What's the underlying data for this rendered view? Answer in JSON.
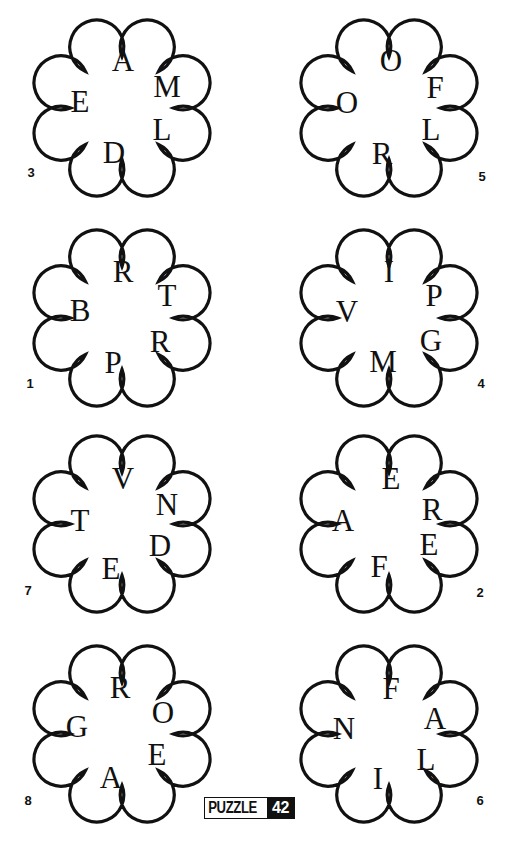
{
  "puzzle_badge": {
    "label": "PUZZLE",
    "number": "42"
  },
  "colors": {
    "ink": "#111111",
    "background": "#ffffff"
  },
  "clouds": [
    {
      "id": "3",
      "center": [
        122,
        108
      ],
      "number_pos": [
        31,
        172
      ],
      "letters": [
        {
          "char": "A",
          "dx": 1,
          "dy": -48
        },
        {
          "char": "M",
          "dx": 45,
          "dy": -22
        },
        {
          "char": "E",
          "dx": -42,
          "dy": -7
        },
        {
          "char": "L",
          "dx": 40,
          "dy": 21
        },
        {
          "char": "D",
          "dx": -8,
          "dy": 44
        }
      ]
    },
    {
      "id": "5",
      "center": [
        389,
        108
      ],
      "number_pos": [
        482,
        176
      ],
      "letters": [
        {
          "char": "O",
          "dx": 2,
          "dy": -48
        },
        {
          "char": "F",
          "dx": 46,
          "dy": -21
        },
        {
          "char": "O",
          "dx": -42,
          "dy": -6
        },
        {
          "char": "L",
          "dx": 42,
          "dy": 21
        },
        {
          "char": "R",
          "dx": -7,
          "dy": 45
        }
      ]
    },
    {
      "id": "1",
      "center": [
        122,
        318
      ],
      "number_pos": [
        30,
        383
      ],
      "letters": [
        {
          "char": "R",
          "dx": 1,
          "dy": -47
        },
        {
          "char": "T",
          "dx": 45,
          "dy": -23
        },
        {
          "char": "B",
          "dx": -42,
          "dy": -8
        },
        {
          "char": "R",
          "dx": 38,
          "dy": 23
        },
        {
          "char": "P",
          "dx": -9,
          "dy": 44
        }
      ]
    },
    {
      "id": "4",
      "center": [
        389,
        318
      ],
      "number_pos": [
        481,
        383
      ],
      "letters": [
        {
          "char": "I",
          "dx": 0,
          "dy": -47
        },
        {
          "char": "P",
          "dx": 45,
          "dy": -23
        },
        {
          "char": "V",
          "dx": -42,
          "dy": -7
        },
        {
          "char": "G",
          "dx": 42,
          "dy": 22
        },
        {
          "char": "M",
          "dx": -6,
          "dy": 43
        }
      ]
    },
    {
      "id": "7",
      "center": [
        122,
        524
      ],
      "number_pos": [
        28,
        590
      ],
      "letters": [
        {
          "char": "V",
          "dx": 1,
          "dy": -46
        },
        {
          "char": "N",
          "dx": 45,
          "dy": -20
        },
        {
          "char": "T",
          "dx": -42,
          "dy": -4
        },
        {
          "char": "D",
          "dx": 38,
          "dy": 21
        },
        {
          "char": "E",
          "dx": -11,
          "dy": 44
        }
      ]
    },
    {
      "id": "2",
      "center": [
        389,
        524
      ],
      "number_pos": [
        480,
        592
      ],
      "letters": [
        {
          "char": "E",
          "dx": 2,
          "dy": -46
        },
        {
          "char": "R",
          "dx": 43,
          "dy": -15
        },
        {
          "char": "A",
          "dx": -46,
          "dy": -4
        },
        {
          "char": "E",
          "dx": 40,
          "dy": 20
        },
        {
          "char": "F",
          "dx": -10,
          "dy": 42
        }
      ]
    },
    {
      "id": "8",
      "center": [
        122,
        734
      ],
      "number_pos": [
        28,
        800
      ],
      "letters": [
        {
          "char": "R",
          "dx": -2,
          "dy": -47
        },
        {
          "char": "O",
          "dx": 41,
          "dy": -22
        },
        {
          "char": "G",
          "dx": -45,
          "dy": -8
        },
        {
          "char": "E",
          "dx": 35,
          "dy": 20
        },
        {
          "char": "A",
          "dx": -11,
          "dy": 43
        }
      ]
    },
    {
      "id": "6",
      "center": [
        389,
        734
      ],
      "number_pos": [
        480,
        800
      ],
      "letters": [
        {
          "char": "F",
          "dx": 2,
          "dy": -46
        },
        {
          "char": "A",
          "dx": 46,
          "dy": -16
        },
        {
          "char": "N",
          "dx": -45,
          "dy": -6
        },
        {
          "char": "L",
          "dx": 37,
          "dy": 25
        },
        {
          "char": "I",
          "dx": -11,
          "dy": 44
        }
      ]
    }
  ]
}
